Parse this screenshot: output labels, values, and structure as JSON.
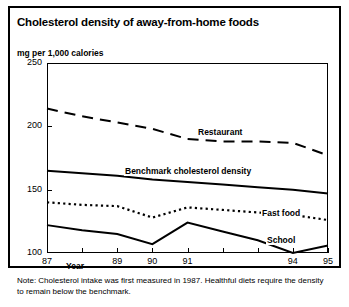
{
  "title": "Cholesterol density of away-from-home foods",
  "subtitle": "mg per 1,000 calories",
  "axis": {
    "year_tag": "Year",
    "y_ticks": [
      "250",
      "200",
      "150",
      "100"
    ],
    "x_ticks": [
      "87",
      "",
      "89",
      "90",
      "91",
      "",
      "",
      "94",
      "95"
    ]
  },
  "labels": {
    "restaurant": "Restaurant",
    "benchmark": "Benchmark cholesterol density",
    "fast_food": "Fast food",
    "school": "School"
  },
  "note": "Note: Cholesterol intake was first measured in 1987. Healthful diets require the density to remain below the benchmark.",
  "colors": {
    "ink": "#000000",
    "paper": "#ffffff"
  },
  "chart_data": {
    "type": "line",
    "title": "Cholesterol density of away-from-home foods",
    "xlabel": "Year",
    "ylabel": "mg per 1,000 calories",
    "x": [
      1987,
      1988,
      1989,
      1990,
      1991,
      1992,
      1993,
      1994,
      1995
    ],
    "tick_labels": [
      "87",
      "88",
      "89",
      "90",
      "91",
      "92",
      "93",
      "94",
      "95"
    ],
    "shown_tick_labels": [
      "87",
      "89",
      "90",
      "91",
      "94",
      "95"
    ],
    "xlim": [
      1987,
      1995
    ],
    "ylim": [
      100,
      250
    ],
    "y_ticks": [
      100,
      150,
      200,
      250
    ],
    "grid": false,
    "legend": "inline-labels",
    "series": [
      {
        "name": "Restaurant",
        "style": "dashed",
        "values": [
          214,
          208,
          203,
          198,
          190,
          188,
          188,
          187,
          177
        ]
      },
      {
        "name": "Benchmark cholesterol density",
        "style": "solid",
        "values": [
          165,
          163,
          161,
          158,
          156,
          154,
          152,
          150,
          147
        ]
      },
      {
        "name": "Fast food",
        "style": "dotted",
        "values": [
          140,
          138,
          137,
          128,
          136,
          134,
          132,
          130,
          126
        ]
      },
      {
        "name": "School",
        "style": "solid",
        "values": [
          122,
          118,
          115,
          107,
          124,
          117,
          110,
          100,
          106
        ]
      }
    ],
    "annotations": [
      "Note: Cholesterol intake was first measured in 1987. Healthful diets require the density to remain below the benchmark."
    ]
  }
}
